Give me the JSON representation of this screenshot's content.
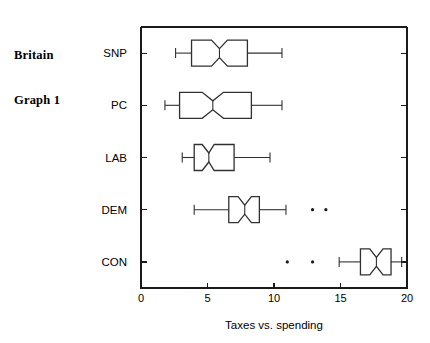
{
  "title": {
    "line1": "Britain",
    "line2": "Graph 1"
  },
  "chart_data": {
    "type": "box",
    "title": "Britain Graph 1",
    "xlabel": "Taxes vs. spending",
    "ylabel": "",
    "orientation": "horizontal",
    "xlim": [
      0,
      20
    ],
    "xticks": [
      0,
      5,
      10,
      15,
      20
    ],
    "xticklabels": [
      "0",
      "5",
      "10",
      "15",
      "20"
    ],
    "grid": false,
    "legend": false,
    "notched": true,
    "categories": [
      "SNP",
      "PC",
      "LAB",
      "DEM",
      "CON"
    ],
    "boxes": [
      {
        "category": "SNP",
        "whisker_low": 2.6,
        "q1": 3.8,
        "median": 5.9,
        "q3": 8.0,
        "whisker_high": 10.6,
        "notch_low": 5.3,
        "notch_high": 6.5,
        "outliers": []
      },
      {
        "category": "PC",
        "whisker_low": 1.8,
        "q1": 2.9,
        "median": 5.4,
        "q3": 8.3,
        "whisker_high": 10.6,
        "notch_low": 4.6,
        "notch_high": 6.2,
        "outliers": []
      },
      {
        "category": "LAB",
        "whisker_low": 3.1,
        "q1": 4.0,
        "median": 5.1,
        "q3": 7.0,
        "whisker_high": 9.7,
        "notch_low": 4.6,
        "notch_high": 5.5,
        "outliers": []
      },
      {
        "category": "DEM",
        "whisker_low": 4.0,
        "q1": 6.6,
        "median": 7.8,
        "q3": 8.9,
        "whisker_high": 10.9,
        "notch_low": 7.3,
        "notch_high": 8.3,
        "outliers": [
          12.9,
          13.9
        ]
      },
      {
        "category": "CON",
        "whisker_low": 14.9,
        "q1": 16.5,
        "median": 17.7,
        "q3": 18.8,
        "whisker_high": 19.6,
        "notch_low": 17.2,
        "notch_high": 18.2,
        "outliers": [
          11.0,
          12.9
        ]
      }
    ]
  },
  "colors": {
    "axis": "#1a1a1a",
    "box_stroke": "#303030",
    "box_fill": "#ffffff",
    "outlier": "#1a1a1a",
    "background": "#ffffff"
  }
}
